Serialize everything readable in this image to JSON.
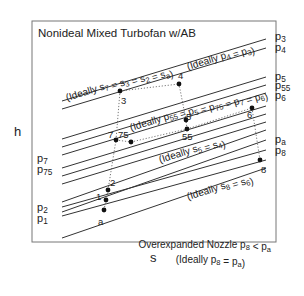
{
  "title": "Nonideal Mixed Turbofan w/AB",
  "axes": {
    "y_label": "h",
    "x_label": "s"
  },
  "isobars": [
    {
      "id": "p3",
      "label": "p",
      "sub": "3",
      "x1": 62,
      "y1": 101,
      "x2": 266,
      "y2": 39
    },
    {
      "id": "p4",
      "label": "p",
      "sub": "4",
      "x1": 62,
      "y1": 109,
      "x2": 266,
      "y2": 48
    },
    {
      "id": "p5",
      "label": "p",
      "sub": "5",
      "x1": 62,
      "y1": 139,
      "x2": 266,
      "y2": 77
    },
    {
      "id": "p55",
      "label": "p",
      "sub": "55",
      "x1": 62,
      "y1": 147,
      "x2": 266,
      "y2": 85
    },
    {
      "id": "p6",
      "label": "p",
      "sub": "6",
      "x1": 62,
      "y1": 155,
      "x2": 266,
      "y2": 93
    },
    {
      "id": "p7",
      "label": "p",
      "sub": "7",
      "x1": 62,
      "y1": 168,
      "x2": 266,
      "y2": 106
    },
    {
      "id": "p75",
      "label": "p",
      "sub": "75",
      "x1": 62,
      "y1": 176,
      "x2": 266,
      "y2": 114
    },
    {
      "id": "l8",
      "label": "",
      "sub": "",
      "x1": 62,
      "y1": 184,
      "x2": 266,
      "y2": 122
    },
    {
      "id": "pa",
      "label": "p",
      "sub": "a",
      "x1": 62,
      "y1": 202,
      "x2": 266,
      "y2": 130
    },
    {
      "id": "p8",
      "label": "p",
      "sub": "8",
      "x1": 62,
      "y1": 212,
      "x2": 266,
      "y2": 140
    },
    {
      "id": "p2",
      "label": "p",
      "sub": "2",
      "x1": 62,
      "y1": 207,
      "x2": 266,
      "y2": 150
    },
    {
      "id": "p1",
      "label": "p",
      "sub": "1",
      "x1": 62,
      "y1": 216,
      "x2": 266,
      "y2": 160
    },
    {
      "id": "l13",
      "label": "",
      "sub": "",
      "x1": 62,
      "y1": 238,
      "x2": 266,
      "y2": 168
    }
  ],
  "left_labels": [
    {
      "text": "p",
      "sub": "7",
      "x": 37,
      "y": 162
    },
    {
      "text": "p",
      "sub": "75",
      "x": 37,
      "y": 173
    },
    {
      "text": "p",
      "sub": "2",
      "x": 37,
      "y": 211
    },
    {
      "text": "p",
      "sub": "1",
      "x": 37,
      "y": 222
    }
  ],
  "right_labels": [
    {
      "text": "p",
      "sub": "3",
      "x": 275,
      "y": 40
    },
    {
      "text": "p",
      "sub": "4",
      "x": 275,
      "y": 51
    },
    {
      "text": "p",
      "sub": "5",
      "x": 275,
      "y": 80
    },
    {
      "text": "p",
      "sub": "55",
      "x": 275,
      "y": 89
    },
    {
      "text": "p",
      "sub": "6",
      "x": 275,
      "y": 99
    },
    {
      "text": "p",
      "sub": "a",
      "x": 275,
      "y": 143
    },
    {
      "text": "p",
      "sub": "8",
      "x": 275,
      "y": 154
    }
  ],
  "states": [
    {
      "id": "a",
      "label": "a",
      "cx": 104,
      "cy": 210,
      "lx": 98,
      "ly": 225
    },
    {
      "id": "1",
      "label": "1",
      "cx": 106,
      "cy": 200,
      "lx": 96,
      "ly": 200
    },
    {
      "id": "2",
      "label": "2",
      "cx": 108,
      "cy": 190,
      "lx": 110,
      "ly": 186
    },
    {
      "id": "3",
      "label": "3",
      "cx": 120,
      "cy": 91,
      "lx": 121,
      "ly": 104
    },
    {
      "id": "7",
      "label": "7",
      "cx": 116,
      "cy": 140,
      "lx": 108,
      "ly": 138
    },
    {
      "id": "75",
      "label": "75",
      "cx": 131,
      "cy": 142,
      "lx": 118,
      "ly": 138
    },
    {
      "id": "4",
      "label": "4",
      "cx": 179,
      "cy": 84,
      "lx": 178,
      "ly": 79
    },
    {
      "id": "5",
      "label": "5",
      "cx": 186,
      "cy": 120,
      "lx": 186,
      "ly": 120
    },
    {
      "id": "55",
      "label": "55",
      "cx": 187,
      "cy": 129,
      "lx": 182,
      "ly": 140
    },
    {
      "id": "6",
      "label": "6",
      "cx": 252,
      "cy": 108,
      "lx": 247,
      "ly": 118
    },
    {
      "id": "8",
      "label": "8",
      "cx": 260,
      "cy": 160,
      "lx": 261,
      "ly": 173
    }
  ],
  "annotations": [
    {
      "id": "ideal-s7",
      "text": "(Ideally s",
      "sub1": "7",
      "rest": " = s",
      "sub2": "3",
      "rest2": " = s",
      "sub3": "2",
      "rest3": " = s",
      "sub4": "a",
      "end": ")",
      "x": 67,
      "y": 101,
      "angle": -17
    },
    {
      "id": "ideal-p4",
      "text": "(Ideally p",
      "sub1": "4",
      "rest": " = p",
      "sub2": "3",
      "end": ")",
      "x": 188,
      "y": 70,
      "angle": -17
    },
    {
      "id": "ideal-p55",
      "text": "(Ideally p",
      "sub1": "55",
      "rest": " = p",
      "sub2": "5",
      "rest2": " = p",
      "sub3": "75",
      "rest3": " = p",
      "sub4": "7",
      "rest4": " = p",
      "sub5": "6",
      "end": ")",
      "x": 131,
      "y": 131,
      "angle": -17
    },
    {
      "id": "ideal-s5",
      "text": "(Ideally s",
      "sub1": "5",
      "rest": " = s",
      "sub2": "4",
      "end": ")",
      "x": 160,
      "y": 163,
      "angle": -17
    },
    {
      "id": "ideal-s8",
      "text": "(Ideally s",
      "sub1": "8",
      "rest": " = s",
      "sub2": "6",
      "end": ")",
      "x": 188,
      "y": 200,
      "angle": -17
    }
  ],
  "footnote": {
    "line1": "Overexpanded Nozzle",
    "line1_cond": "p",
    "line1_sub1": "8",
    "line1_op": " < p",
    "line1_sub2": "a",
    "line2": "(Ideally p",
    "line2_sub1": "8",
    "line2_op": " = p",
    "line2_sub2": "a",
    "line2_end": ")"
  }
}
